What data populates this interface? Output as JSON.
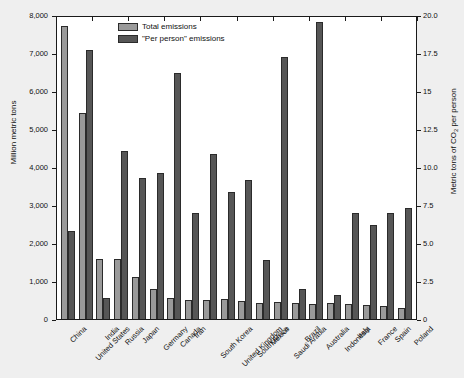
{
  "chart_data": {
    "type": "bar",
    "title": "",
    "subtitle": "",
    "xlabel": "",
    "ylabel": "Million metric tons",
    "y2label": "Metric tons of CO2 per person",
    "y2label_prefix": "Metric tons of CO",
    "y2label_sub": "2",
    "y2label_suffix": " per person",
    "grid": false,
    "legend_position": "top-center",
    "ylim": [
      0,
      8000
    ],
    "y2lim": [
      0,
      20.0
    ],
    "ytick_labels": [
      "8,000",
      "7,000",
      "6,000",
      "5,000",
      "4,000",
      "3,000",
      "2,000",
      "1,000",
      "0"
    ],
    "ytick_values": [
      8000,
      7000,
      6000,
      5000,
      4000,
      3000,
      2000,
      1000,
      0
    ],
    "y2tick_labels": [
      "20.0",
      "17.5",
      "15",
      "12.5",
      "10.0",
      "7.5",
      "5.0",
      "2.5",
      "0"
    ],
    "y2tick_values": [
      20.0,
      17.5,
      15,
      12.5,
      10.0,
      7.5,
      5.0,
      2.5,
      0
    ],
    "categories": [
      "China",
      "United States",
      "India",
      "Russia",
      "Japan",
      "Germany",
      "Canada",
      "Iran",
      "South Korea",
      "United Kingdom",
      "South Africa",
      "Mexico",
      "Saudi Arabia",
      "Brazil",
      "Australia",
      "Indonesia",
      "Italy",
      "France",
      "Spain",
      "Poland"
    ],
    "series": [
      {
        "name": "Total emissions",
        "axis": "left",
        "unit": "Million metric tons",
        "color": "#9a9a9a",
        "values": [
          7700,
          5420,
          1590,
          1570,
          1100,
          790,
          560,
          510,
          510,
          520,
          470,
          430,
          440,
          420,
          400,
          430,
          400,
          360,
          330,
          300
        ]
      },
      {
        "name": "\"Per person\" emissions",
        "axis": "right",
        "unit": "Metric tons of CO2 per person",
        "color": "#565656",
        "values": [
          5.8,
          17.7,
          1.4,
          11.1,
          9.3,
          9.6,
          16.2,
          7.0,
          10.9,
          8.4,
          9.2,
          3.9,
          17.2,
          2.0,
          19.6,
          1.6,
          7.0,
          6.2,
          7.0,
          7.3
        ],
        "values_left_scale": [
          2310,
          7080,
          550,
          4430,
          3710,
          3840,
          6470,
          2780,
          4350,
          3340,
          3670,
          1560,
          6890,
          800,
          7820,
          640,
          2790,
          2480,
          2800,
          2920
        ]
      }
    ],
    "legend": [
      {
        "label": "Total emissions",
        "color": "#9a9a9a"
      },
      {
        "label": "\"Per person\" emissions",
        "color": "#565656"
      }
    ]
  },
  "colors": {
    "total": "#9a9a9a",
    "per_person": "#565656",
    "axis": "#1a1a1a",
    "background": "#efefef",
    "plot_background": "#ffffff"
  }
}
